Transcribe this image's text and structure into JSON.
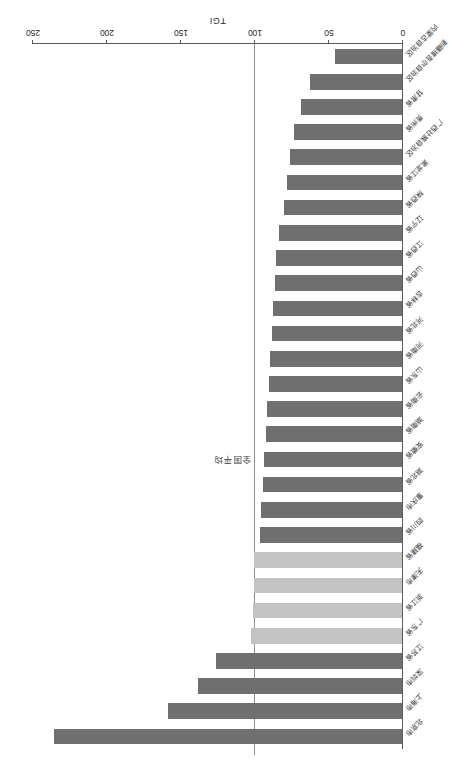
{
  "chart_data": {
    "type": "bar",
    "orientation": "horizontal",
    "title": "",
    "subtitle": "",
    "xlabel": "TGI",
    "ylabel": "",
    "xlim": [
      0,
      250
    ],
    "ticks": [
      "0",
      "50",
      "100",
      "150",
      "200",
      "250"
    ],
    "tick_values": [
      0,
      50,
      100,
      150,
      200,
      250
    ],
    "grid": false,
    "legend": "none",
    "reference_line": {
      "label": "全国平均",
      "value": 100
    },
    "categories": [
      "北京市",
      "上海市",
      "深圳市",
      "江苏省",
      "广东省",
      "浙江省",
      "天津市",
      "福建省",
      "四川省",
      "重庆市",
      "湖北省",
      "安徽省",
      "湖南省",
      "云南省",
      "山东省",
      "河南省",
      "河北省",
      "吉林省",
      "山西省",
      "江西省",
      "辽宁省",
      "陕西省",
      "黑龙江省",
      "广西壮族自治区",
      "贵州省",
      "甘肃省",
      "新疆维吾尔自治区",
      "内蒙古自治区"
    ],
    "values": [
      235,
      158,
      138,
      126,
      102,
      101,
      100,
      100,
      96,
      95,
      94,
      93,
      92,
      91,
      90,
      89,
      88,
      87,
      86,
      85,
      83,
      80,
      78,
      76,
      73,
      68,
      62,
      45
    ],
    "bar_shades": [
      "dark",
      "dark",
      "dark",
      "dark",
      "light",
      "light",
      "light",
      "light",
      "dark",
      "dark",
      "dark",
      "dark",
      "dark",
      "dark",
      "dark",
      "dark",
      "dark",
      "dark",
      "dark",
      "dark",
      "dark",
      "dark",
      "dark",
      "dark",
      "dark",
      "dark",
      "dark",
      "dark"
    ],
    "colors": {
      "bar_dark": "#6f6f6f",
      "bar_light": "#c3c3c3",
      "axis": "#5a5a5a",
      "reference_line": "#8d8d8d",
      "text": "#2b2b2b",
      "background": "#ffffff"
    }
  }
}
